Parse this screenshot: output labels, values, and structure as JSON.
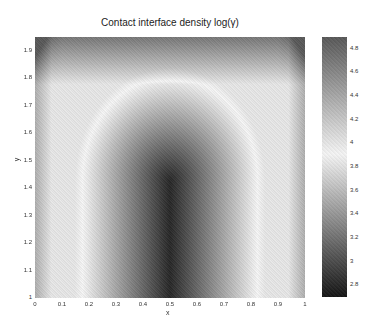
{
  "chart_data": {
    "type": "heatmap",
    "title": "Contact interface density log(γ)",
    "xlabel": "x",
    "ylabel": "y",
    "xlim": [
      0,
      1
    ],
    "ylim": [
      1,
      1.95
    ],
    "x_ticks": [
      "0",
      "0.1",
      "0.2",
      "0.3",
      "0.4",
      "0.5",
      "0.6",
      "0.7",
      "0.8",
      "0.9",
      "1"
    ],
    "y_ticks": [
      "1",
      "1.1",
      "1.2",
      "1.3",
      "1.4",
      "1.5",
      "1.6",
      "1.7",
      "1.8",
      "1.9"
    ],
    "colorbar": {
      "range": [
        2.7,
        4.9
      ],
      "ticks": [
        "2.8",
        "3",
        "3.2",
        "3.4",
        "3.6",
        "3.8",
        "4",
        "4.2",
        "4.4",
        "4.6",
        "4.8"
      ],
      "colormap": "gray"
    }
  },
  "plot": {
    "title": "Contact interface density log(γ)",
    "xlabel": "x",
    "ylabel": "y"
  }
}
